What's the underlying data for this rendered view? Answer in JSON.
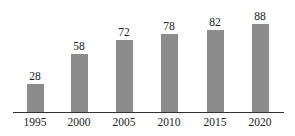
{
  "chart_data": {
    "type": "bar",
    "title": "",
    "xlabel": "",
    "ylabel": "",
    "categories": [
      "1995",
      "2000",
      "2005",
      "2010",
      "2015",
      "2020"
    ],
    "values": [
      28,
      58,
      72,
      78,
      82,
      88
    ],
    "data_labels": [
      "28",
      "58",
      "72",
      "78",
      "82",
      "88"
    ],
    "ylim": [
      0,
      100
    ],
    "grid": false,
    "legend": null,
    "y_axis_visible": false,
    "bar_color": "#8c8c8c"
  }
}
